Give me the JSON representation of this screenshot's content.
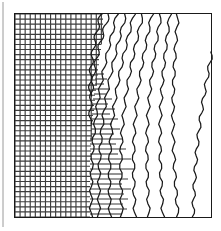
{
  "figure": {
    "caption": "",
    "background_color": "#ffffff",
    "line_color": "#1a1a1a",
    "grid_color": "#3d3d3d",
    "frame": {
      "x": 14,
      "y": 13,
      "width": 198,
      "height": 205,
      "stroke": "#1a1a1a",
      "stroke_width": 1
    },
    "left_margin_rule": {
      "x": 3,
      "y0": 2,
      "y1": 227,
      "stroke": "#9a9a9a",
      "stroke_width": 1
    }
  },
  "chart_data": {
    "type": "line",
    "title": "",
    "subtitle": "",
    "xlabel": "",
    "ylabel": "",
    "xlim": [
      14,
      212
    ],
    "ylim": [
      13,
      218
    ],
    "grid": true,
    "legend_position": "none",
    "annotations": [],
    "tick_labels": {
      "x": [],
      "y": []
    },
    "mesh": {
      "name": "structured-grid",
      "x_start": 15,
      "y_start": 14,
      "y_end": 217,
      "cell_size": 5.08,
      "columns": 18,
      "rows": 40,
      "stroke": "#3d3d3d",
      "stroke_width": 1.15,
      "right_edge_profile": [
        103,
        103,
        103,
        103,
        102,
        102,
        101,
        101,
        100,
        99,
        99,
        98,
        98,
        97,
        96,
        96,
        95,
        95,
        94,
        94,
        93,
        93,
        92,
        92,
        92,
        91,
        91,
        91,
        90,
        90,
        90,
        90,
        90,
        90,
        90,
        90,
        90,
        90,
        90,
        90
      ]
    },
    "stubs": {
      "name": "horizontal-grid-stubs",
      "stroke": "#3d3d3d",
      "stroke_width": 1.1,
      "rows": [
        {
          "y": 74,
          "x0": 96,
          "x1": 104
        },
        {
          "y": 79,
          "x0": 95,
          "x1": 107
        },
        {
          "y": 84,
          "x0": 95,
          "x1": 104
        },
        {
          "y": 89,
          "x0": 94,
          "x1": 110
        },
        {
          "y": 94,
          "x0": 94,
          "x1": 106
        },
        {
          "y": 99,
          "x0": 93,
          "x1": 112
        },
        {
          "y": 104,
          "x0": 93,
          "x1": 108
        },
        {
          "y": 109,
          "x0": 92,
          "x1": 115
        },
        {
          "y": 114,
          "x0": 92,
          "x1": 110
        },
        {
          "y": 119,
          "x0": 92,
          "x1": 118
        },
        {
          "y": 124,
          "x0": 91,
          "x1": 112
        },
        {
          "y": 129,
          "x0": 91,
          "x1": 120
        },
        {
          "y": 134,
          "x0": 91,
          "x1": 114
        },
        {
          "y": 139,
          "x0": 90,
          "x1": 123
        },
        {
          "y": 144,
          "x0": 90,
          "x1": 116
        },
        {
          "y": 149,
          "x0": 90,
          "x1": 126
        },
        {
          "y": 154,
          "x0": 90,
          "x1": 118
        },
        {
          "y": 159,
          "x0": 90,
          "x1": 131
        },
        {
          "y": 164,
          "x0": 90,
          "x1": 120
        },
        {
          "y": 169,
          "x0": 90,
          "x1": 134
        },
        {
          "y": 174,
          "x0": 90,
          "x1": 122
        },
        {
          "y": 179,
          "x0": 90,
          "x1": 128
        },
        {
          "y": 184,
          "x0": 90,
          "x1": 122
        },
        {
          "y": 189,
          "x0": 90,
          "x1": 131
        },
        {
          "y": 194,
          "x0": 90,
          "x1": 124
        },
        {
          "y": 199,
          "x0": 90,
          "x1": 128
        },
        {
          "y": 204,
          "x0": 90,
          "x1": 123
        },
        {
          "y": 209,
          "x0": 90,
          "x1": 127
        },
        {
          "y": 214,
          "x0": 90,
          "x1": 122
        }
      ]
    },
    "curves": {
      "name": "streamline-family",
      "count": 11,
      "stroke": "#1a1a1a",
      "stroke_width": 1.25,
      "wave_amplitude": 1.6,
      "wave_period": 17,
      "series": [
        {
          "name": "streamline-1",
          "top_x": 101,
          "bottom_x": 90,
          "top_y": 14,
          "bottom_y": 96,
          "bow": 3
        },
        {
          "name": "streamline-2",
          "top_x": 109,
          "bottom_x": 90,
          "top_y": 14,
          "bottom_y": 124,
          "bow": 5
        },
        {
          "name": "streamline-3",
          "top_x": 117,
          "bottom_x": 91,
          "top_y": 14,
          "bottom_y": 217,
          "bow": 8
        },
        {
          "name": "streamline-4",
          "top_x": 126,
          "bottom_x": 99,
          "top_y": 14,
          "bottom_y": 217,
          "bow": 9
        },
        {
          "name": "streamline-5",
          "top_x": 134,
          "bottom_x": 110,
          "top_y": 14,
          "bottom_y": 217,
          "bow": 9
        },
        {
          "name": "streamline-6",
          "top_x": 143,
          "bottom_x": 122,
          "top_y": 14,
          "bottom_y": 217,
          "bow": 9
        },
        {
          "name": "streamline-7",
          "top_x": 152,
          "bottom_x": 135,
          "top_y": 14,
          "bottom_y": 217,
          "bow": 8
        },
        {
          "name": "streamline-8",
          "top_x": 161,
          "bottom_x": 149,
          "top_y": 14,
          "bottom_y": 217,
          "bow": 7
        },
        {
          "name": "streamline-9",
          "top_x": 170,
          "bottom_x": 163,
          "top_y": 14,
          "bottom_y": 217,
          "bow": 6
        },
        {
          "name": "streamline-10",
          "top_x": 178,
          "bottom_x": 178,
          "top_y": 14,
          "bottom_y": 217,
          "bow": 5
        },
        {
          "name": "streamline-11",
          "top_x": 212,
          "bottom_x": 193,
          "top_y": 52,
          "bottom_y": 217,
          "bow": 4
        }
      ]
    }
  }
}
